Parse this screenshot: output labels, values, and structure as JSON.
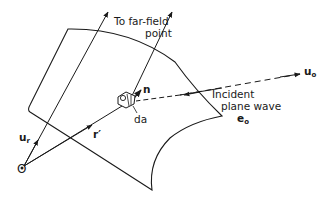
{
  "diagram": {
    "type": "scattering-geometry",
    "labels": {
      "far_field_line1": "To far-field",
      "far_field_line2": "point",
      "normal": "n",
      "area_element": "da",
      "incident_line1": "Incident",
      "incident_line2": "plane wave",
      "polarization": "e",
      "polarization_sub": "o",
      "incident_direction": "u",
      "incident_direction_sub": "o",
      "radial_unit": "u",
      "radial_unit_sub": "r",
      "position_vector": "r′",
      "origin": "O"
    },
    "colors": {
      "ink": "#1a1a1a",
      "background": "#ffffff"
    }
  }
}
